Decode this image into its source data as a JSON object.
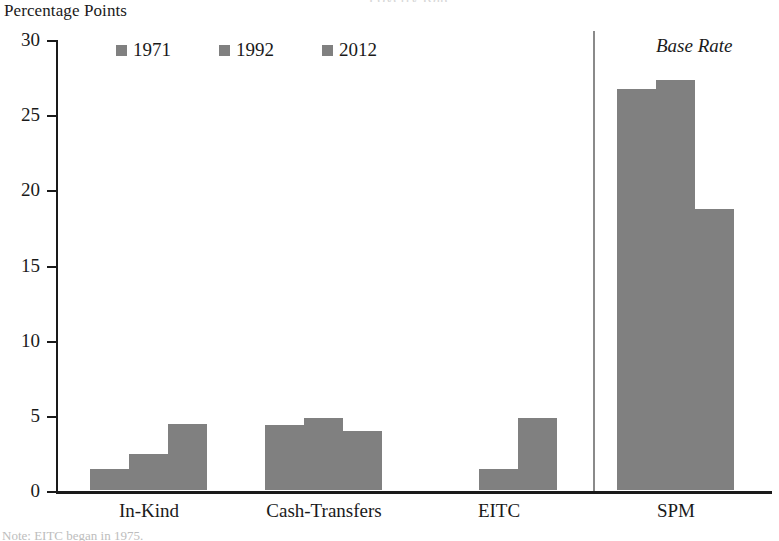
{
  "axis_title": "Percentage Points",
  "clipped_title": "Poverty Rate",
  "note": "Note: EITC began in 1975.",
  "annotation": "Base Rate",
  "colors": {
    "bar": "#808080",
    "axis": "#1a1a1a",
    "separator": "#8a8a8a"
  },
  "legend": {
    "items": [
      {
        "label": "1971"
      },
      {
        "label": "1992"
      },
      {
        "label": "2012"
      }
    ]
  },
  "chart_data": {
    "type": "bar",
    "title": "Poverty Rate",
    "xlabel": "",
    "ylabel": "Percentage Points",
    "ylim": [
      0,
      30
    ],
    "yticks": [
      0,
      5,
      10,
      15,
      20,
      25,
      30
    ],
    "ytick_labels": [
      "0",
      "5",
      "10",
      "15",
      "20",
      "25",
      "30"
    ],
    "grid": false,
    "legend_position": "top-left",
    "categories": [
      "In-Kind",
      "Cash-Transfers",
      "EITC",
      "SPM"
    ],
    "series": [
      {
        "name": "1971",
        "values": [
          1.4,
          4.3,
          0,
          26.7
        ]
      },
      {
        "name": "1992",
        "values": [
          2.4,
          4.8,
          1.4,
          27.3
        ]
      },
      {
        "name": "2012",
        "values": [
          4.4,
          3.9,
          4.8,
          18.7
        ]
      }
    ],
    "annotations": [
      {
        "text": "Base Rate",
        "category": "SPM",
        "style": "italic"
      }
    ],
    "notes": "Note: EITC began in 1975."
  },
  "layout": {
    "groups": [
      {
        "label": "In-Kind",
        "left": 34,
        "bar_width": 39,
        "bar_gap": 0,
        "label_center": 93,
        "spm": false
      },
      {
        "label": "Cash-Transfers",
        "left": 209,
        "bar_width": 39,
        "bar_gap": 0,
        "label_center": 268,
        "spm": false
      },
      {
        "label": "EITC",
        "left": 384,
        "bar_width": 39,
        "bar_gap": 0,
        "label_center": 443,
        "spm": false
      },
      {
        "label": "SPM",
        "left": 561,
        "bar_width": 39,
        "bar_gap": 0,
        "label_center": 620,
        "spm": true
      }
    ],
    "separator_x": 537
  }
}
